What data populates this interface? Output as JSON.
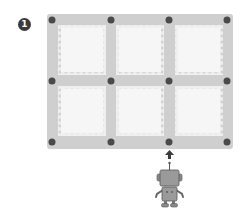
{
  "figure": {
    "step_badge": "1",
    "grid": {
      "rows": 2,
      "cols": 3,
      "frame_color": "#cfcfcf",
      "cell_color": "#f4f4f4",
      "node_color": "#4a4a4a"
    },
    "robot": {
      "color": "#9a9a9a",
      "direction": "up"
    },
    "arrow": {
      "direction": "up"
    }
  }
}
